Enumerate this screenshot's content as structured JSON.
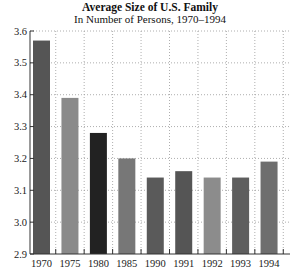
{
  "chart_data": {
    "type": "bar",
    "title": "Average Size of U.S. Family",
    "subtitle": "In Number of Persons, 1970–1994",
    "xlabel": "",
    "ylabel": "",
    "categories": [
      "1970",
      "1975",
      "1980",
      "1985",
      "1990",
      "1991",
      "1992",
      "1993",
      "1994"
    ],
    "values": [
      3.57,
      3.39,
      3.28,
      3.2,
      3.14,
      3.16,
      3.14,
      3.14,
      3.19
    ],
    "colors": [
      "#555555",
      "#8a8a8a",
      "#222222",
      "#777777",
      "#5a5a5a",
      "#555555",
      "#8c8c8c",
      "#5e5e5e",
      "#6e6e6e"
    ],
    "ylim": [
      2.9,
      3.6
    ],
    "yticks": [
      "2.9",
      "3.0",
      "3.1",
      "3.2",
      "3.3",
      "3.4",
      "3.5",
      "3.6"
    ],
    "grid": true,
    "legend": "none"
  }
}
